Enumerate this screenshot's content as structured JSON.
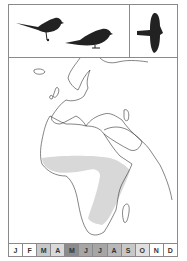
{
  "panels": {
    "perched_birds_icon": "perched-bird-silhouettes",
    "flight_icon": "flying-bird-silhouette"
  },
  "map": {
    "region": "Europe and Africa",
    "range_color": "#d8d8d8",
    "outline_color": "#333333"
  },
  "months": [
    {
      "label": "J",
      "shade": "#ffffff"
    },
    {
      "label": "F",
      "shade": "#ffffff"
    },
    {
      "label": "M",
      "shade": "#c8c8c8"
    },
    {
      "label": "A",
      "shade": "#d9d9d9"
    },
    {
      "label": "M",
      "shade": "#8c8c8c"
    },
    {
      "label": "J",
      "shade": "#a6a6a6"
    },
    {
      "label": "J",
      "shade": "#a6a6a6"
    },
    {
      "label": "A",
      "shade": "#b8b8b8"
    },
    {
      "label": "S",
      "shade": "#c8c8c8"
    },
    {
      "label": "O",
      "shade": "#e0e0e0"
    },
    {
      "label": "N",
      "shade": "#ffffff"
    },
    {
      "label": "D",
      "shade": "#ffffff"
    }
  ]
}
